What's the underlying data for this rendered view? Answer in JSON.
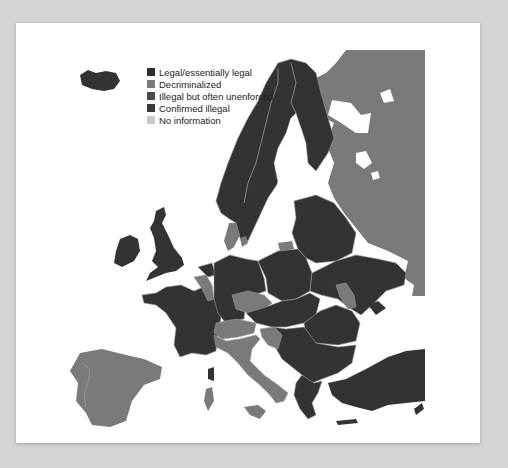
{
  "legend": {
    "items": [
      {
        "label": "Legal/essentially legal",
        "color": "#2e2e30"
      },
      {
        "label": "Decriminalized",
        "color": "#7a7a7c"
      },
      {
        "label": "Illegal but often unenforced",
        "color": "#4a4a4c"
      },
      {
        "label": "Confirmed illegal",
        "color": "#3a3a3c"
      },
      {
        "label": "No information",
        "color": "#c9c9c9"
      }
    ]
  },
  "colors": {
    "page_background": "#d4d4d4",
    "card_background": "#ffffff",
    "border_line": "#9a9a9a",
    "dark": "#333335",
    "mid": "#7a7a7c"
  },
  "map": {
    "regions": [
      {
        "name": "Russia",
        "status": "Decriminalized"
      },
      {
        "name": "Scandinavia (Norway, Sweden, Finland)",
        "status": "Legal/essentially legal"
      },
      {
        "name": "Iceland",
        "status": "Legal/essentially legal"
      },
      {
        "name": "United Kingdom & Ireland",
        "status": "Legal/essentially legal"
      },
      {
        "name": "France",
        "status": "Legal/essentially legal"
      },
      {
        "name": "Belgium",
        "status": "Decriminalized"
      },
      {
        "name": "Netherlands",
        "status": "Legal/essentially legal"
      },
      {
        "name": "Denmark",
        "status": "Decriminalized"
      },
      {
        "name": "Germany",
        "status": "Legal/essentially legal"
      },
      {
        "name": "Poland",
        "status": "Legal/essentially legal"
      },
      {
        "name": "Czech Republic",
        "status": "Decriminalized"
      },
      {
        "name": "Switzerland",
        "status": "Decriminalized"
      },
      {
        "name": "Italy",
        "status": "Decriminalized"
      },
      {
        "name": "Spain & Portugal",
        "status": "Decriminalized"
      },
      {
        "name": "Croatia",
        "status": "Decriminalized"
      },
      {
        "name": "Moldova",
        "status": "Decriminalized"
      },
      {
        "name": "Kaliningrad",
        "status": "Decriminalized"
      },
      {
        "name": "Baltics, Belarus, Ukraine, Balkans, Turkey, Greece",
        "status": "Legal/essentially legal"
      }
    ]
  }
}
